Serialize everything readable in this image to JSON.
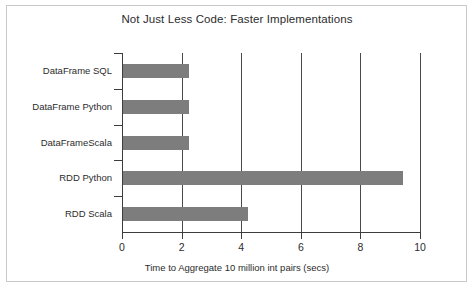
{
  "chart_data": {
    "type": "bar",
    "orientation": "horizontal",
    "title": "Not Just Less Code: Faster Implementations",
    "xlabel": "Time to Aggregate 10 million int pairs (secs)",
    "ylabel": "",
    "categories": [
      "DataFrame SQL",
      "DataFrame Python",
      "DataFrameScala",
      "RDD Python",
      "RDD Scala"
    ],
    "values": [
      2.2,
      2.2,
      2.2,
      9.4,
      4.2
    ],
    "xlim": [
      0,
      10
    ],
    "xticks": [
      0,
      2,
      4,
      6,
      8,
      10
    ],
    "xtick_labels": [
      "0",
      "2",
      "4",
      "6",
      "8",
      "10"
    ],
    "grid": "vertical",
    "legend": null,
    "bar_color": "#7d7d7d",
    "axis_color": "#3d3d3d",
    "gridline_color": "#4a4a4a",
    "background_color": "#ffffff",
    "frame_color": "#c9c9c9"
  }
}
